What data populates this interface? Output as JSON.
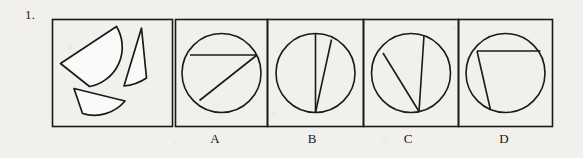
{
  "question": {
    "number": "1.",
    "type": "spatial-reasoning-shape-assembly"
  },
  "colors": {
    "background": "#f2f0ec",
    "ink": "#16161a",
    "stroke": "#1a1a1c"
  },
  "panels": {
    "prompt": {
      "name": "prompt-panel",
      "label": "",
      "pieces": [
        {
          "name": "large-circular-segment",
          "description": "large half-disc segment, chord from lower-left to upper-right, arc bulging downward-right"
        },
        {
          "name": "narrow-sliver-segment",
          "description": "thin elongated crescent sliver, near vertical, pointed at the top"
        },
        {
          "name": "small-flat-segment",
          "description": "shallow circular segment, chord on top, arc bulging downward"
        }
      ]
    },
    "options": [
      {
        "label": "A",
        "name": "option-a",
        "description": "circle with a horizontal chord near the top and a diagonal chord from the lower-left arc to the right end of the horizontal chord"
      },
      {
        "label": "B",
        "name": "option-b",
        "description": "circle with a vertical diameter and a second chord from near the top forming a narrow sliver to the right of the diameter"
      },
      {
        "label": "C",
        "name": "option-c",
        "description": "circle with a near-vertical chord right of center and a diagonal chord from the upper-left arc to the bottom of the vertical chord"
      },
      {
        "label": "D",
        "name": "option-d",
        "description": "circle with a horizontal chord near the top and a steep chord from the left end of that chord down to the lower arc"
      }
    ]
  }
}
